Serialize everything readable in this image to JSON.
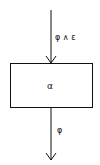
{
  "diagram": {
    "block": {
      "label": "α"
    },
    "input_edge": {
      "label": "φ ∧ ε"
    },
    "output_edge": {
      "label": "φ"
    },
    "colors": {
      "stroke": "#111111",
      "background": "#ffffff"
    }
  }
}
